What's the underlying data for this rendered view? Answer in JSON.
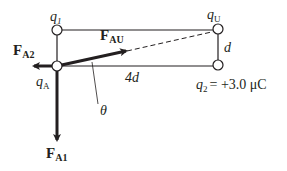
{
  "diagram": {
    "type": "electrostatic-force-diagram",
    "charges": [
      {
        "id": "q1",
        "label": "q",
        "subscript": "1",
        "position": "top-left"
      },
      {
        "id": "qU",
        "label": "q",
        "subscript": "U",
        "position": "top-right"
      },
      {
        "id": "qA",
        "label": "q",
        "subscript": "A",
        "position": "bottom-left"
      },
      {
        "id": "q2",
        "label": "q",
        "subscript": "2",
        "position": "bottom-right",
        "value_text": "= +3.0 μC"
      }
    ],
    "dimensions": {
      "width_label": "4d",
      "height_label": "d"
    },
    "forces": [
      {
        "id": "FA2",
        "label": "F",
        "subscript": "A2",
        "direction": "left"
      },
      {
        "id": "FAU",
        "label": "F",
        "subscript": "AU",
        "direction": "toward qU"
      },
      {
        "id": "FA1",
        "label": "F",
        "subscript": "A1",
        "direction": "down"
      }
    ],
    "angle_label": "θ",
    "colors": {
      "line": "#231f20",
      "background": "#ffffff"
    }
  }
}
